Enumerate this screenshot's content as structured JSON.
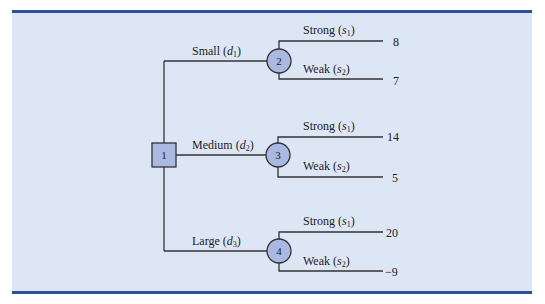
{
  "diagram": {
    "type": "decision-tree",
    "colors": {
      "panel_bg": "#dde6f5",
      "rule": "#2f4f9a",
      "node_fill": "#a9b9e2",
      "line": "#333333"
    },
    "decision_node": {
      "id": "1"
    },
    "decisions": [
      {
        "label_main": "Small (",
        "label_var": "d",
        "label_sub": "1",
        "label_end": ")",
        "chance_node": "2",
        "outcomes": [
          {
            "main": "Strong (",
            "var": "s",
            "sub": "1",
            "end": ")",
            "payoff": "8"
          },
          {
            "main": "Weak (",
            "var": "s",
            "sub": "2",
            "end": ")",
            "payoff": "7"
          }
        ]
      },
      {
        "label_main": "Medium (",
        "label_var": "d",
        "label_sub": "2",
        "label_end": ")",
        "chance_node": "3",
        "outcomes": [
          {
            "main": "Strong (",
            "var": "s",
            "sub": "1",
            "end": ")",
            "payoff": "14"
          },
          {
            "main": "Weak (",
            "var": "s",
            "sub": "2",
            "end": ")",
            "payoff": "5"
          }
        ]
      },
      {
        "label_main": "Large (",
        "label_var": "d",
        "label_sub": "3",
        "label_end": ")",
        "chance_node": "4",
        "outcomes": [
          {
            "main": "Strong (",
            "var": "s",
            "sub": "1",
            "end": ")",
            "payoff": "20"
          },
          {
            "main": "Weak (",
            "var": "s",
            "sub": "2",
            "end": ")",
            "payoff": "−9"
          }
        ]
      }
    ]
  }
}
